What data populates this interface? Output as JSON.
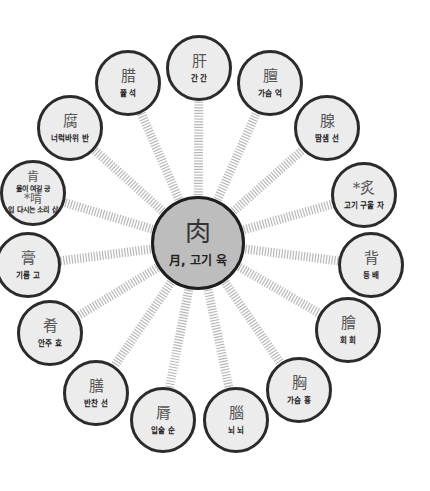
{
  "diagram": {
    "center": {
      "hanja": "肉",
      "reading": "月, 고기 육",
      "x": 198,
      "y": 243,
      "r": 47,
      "fill": "#bdbdbd"
    },
    "node_fill": "#ececec",
    "node_border": "#2b2b2b",
    "spoke_color": "#b8b8b8",
    "nodes": [
      {
        "id": "gan",
        "hanja": "肝",
        "reading": "간 간",
        "x": 199,
        "y": 68,
        "r": 33
      },
      {
        "id": "eok",
        "hanja": "膻",
        "reading": "가슴 억",
        "x": 270,
        "y": 83,
        "r": 33
      },
      {
        "id": "seon1",
        "hanja": "腺",
        "reading": "땀샘 선",
        "x": 327,
        "y": 128,
        "r": 33
      },
      {
        "id": "ja",
        "hanja": "*炙",
        "reading": "고기 구울 자",
        "x": 364,
        "y": 195,
        "r": 33
      },
      {
        "id": "bae",
        "hanja": "背",
        "reading": "등 배",
        "x": 371,
        "y": 265,
        "r": 33
      },
      {
        "id": "hoe",
        "hanja": "膾",
        "reading": "회 회",
        "x": 348,
        "y": 330,
        "r": 33
      },
      {
        "id": "hyung",
        "hanja": "胸",
        "reading": "가슴 흉",
        "x": 299,
        "y": 390,
        "r": 33
      },
      {
        "id": "noe",
        "hanja": "腦",
        "reading": "뇌 뇌",
        "x": 236,
        "y": 420,
        "r": 33
      },
      {
        "id": "sun",
        "hanja": "脣",
        "reading": "입술 순",
        "x": 163,
        "y": 420,
        "r": 33
      },
      {
        "id": "seon2",
        "hanja": "膳",
        "reading": "반찬 선",
        "x": 96,
        "y": 393,
        "r": 33
      },
      {
        "id": "hyo",
        "hanja": "肴",
        "reading": "안주 효",
        "x": 50,
        "y": 333,
        "r": 33
      },
      {
        "id": "go",
        "hanja": "膏",
        "reading": "기름 고",
        "x": 28,
        "y": 265,
        "r": 33
      },
      {
        "id": "geung",
        "hanja": "肯",
        "reading": "옳이 여길 긍",
        "hanja2": "*啃",
        "reading2": "입 다시는 소리 삽",
        "x": 33,
        "y": 193,
        "r": 33
      },
      {
        "id": "ban",
        "hanja": "腐",
        "reading": "너럭바위 반",
        "x": 70,
        "y": 128,
        "r": 33
      },
      {
        "id": "seok",
        "hanja": "腊",
        "reading": "쯀 석",
        "x": 128,
        "y": 83,
        "r": 33
      }
    ]
  }
}
